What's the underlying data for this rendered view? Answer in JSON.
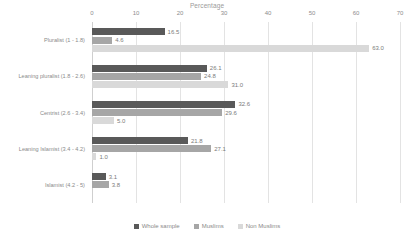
{
  "chart_data": {
    "type": "bar",
    "orientation": "horizontal",
    "title": "Percentage",
    "xlabel": "",
    "ylabel": "",
    "xlim": [
      0,
      70
    ],
    "xticks": [
      0,
      10,
      20,
      30,
      40,
      50,
      60,
      70
    ],
    "grid": true,
    "legend_position": "bottom",
    "categories": [
      "Pluralist (1 - 1.8)",
      "Leaning pluralist (1.8 - 2.6)",
      "Centrist (2.6 - 3.4)",
      "Leaning Islamist (3.4 - 4.2)",
      "Islamist (4.2 - 5)"
    ],
    "series": [
      {
        "name": "Whole sample",
        "color": "#595959",
        "values": [
          16.5,
          26.1,
          32.6,
          21.8,
          3.1
        ],
        "labels": [
          "16.5",
          "26.1",
          "32.6",
          "21.8",
          "3.1"
        ]
      },
      {
        "name": "Muslims",
        "color": "#a6a6a6",
        "values": [
          4.6,
          24.8,
          29.6,
          27.1,
          3.8
        ],
        "labels": [
          "4.6",
          "24.8",
          "29.6",
          "27.1",
          "3.8"
        ]
      },
      {
        "name": "Non Muslims",
        "color": "#d9d9d9",
        "values": [
          63.0,
          31.0,
          5.0,
          1.0,
          0.0
        ],
        "labels": [
          "63.0",
          "31.0",
          "5.0",
          "1.0",
          ""
        ]
      }
    ]
  }
}
